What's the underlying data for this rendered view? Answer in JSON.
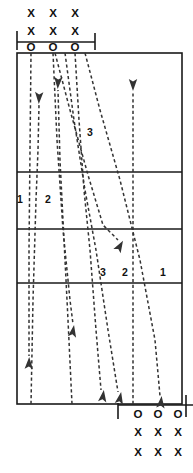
{
  "diagram": {
    "type": "play-diagram",
    "colors": {
      "line": "#1a1a1a",
      "route": "#333333",
      "background": "#ffffff",
      "text": "#111111"
    },
    "field": {
      "left": 17,
      "right": 182,
      "top": 53,
      "bottom": 404,
      "yard_lines_y": [
        172,
        229,
        283
      ]
    },
    "scrimmage": {
      "top": {
        "y": 42,
        "x1": 17,
        "x2": 95
      },
      "bottom": {
        "y": 405,
        "x1": 118,
        "x2": 193
      }
    },
    "top_formation": {
      "rows": [
        {
          "symbol": "X",
          "y": 14,
          "xs": [
            31,
            53,
            75
          ]
        },
        {
          "symbol": "X",
          "y": 32,
          "xs": [
            31,
            53,
            75
          ]
        },
        {
          "symbol": "O",
          "y": 48,
          "xs": [
            31,
            53,
            75
          ]
        }
      ]
    },
    "bottom_formation": {
      "rows": [
        {
          "symbol": "O",
          "y": 415,
          "xs": [
            138,
            158,
            178
          ]
        },
        {
          "symbol": "X",
          "y": 433,
          "xs": [
            138,
            158,
            178
          ]
        },
        {
          "symbol": "X",
          "y": 453,
          "xs": [
            138,
            158,
            178
          ]
        }
      ]
    },
    "route_labels": [
      {
        "text": "3",
        "x": 90,
        "y": 133
      },
      {
        "text": "1",
        "x": 20,
        "y": 200
      },
      {
        "text": "2",
        "x": 48,
        "y": 200
      },
      {
        "text": "3",
        "x": 103,
        "y": 273
      },
      {
        "text": "2",
        "x": 125,
        "y": 273
      },
      {
        "text": "1",
        "x": 163,
        "y": 273
      }
    ],
    "routes": [
      {
        "id": "route-up-1",
        "label": "1",
        "direction": "up",
        "points": "31,404 33,300 36,200 38,150 39,105",
        "arrow": {
          "x": 39,
          "y": 98,
          "angle": 182
        }
      },
      {
        "id": "route-up-2",
        "label": "2",
        "direction": "up",
        "points": "72,404 68,320 64,240 60,160 58,90",
        "arrow": {
          "x": 58,
          "y": 83,
          "angle": 183
        }
      },
      {
        "id": "route-up-3",
        "label": "3",
        "direction": "up",
        "points": "133,404 133,300 133,200 133,130 133,92",
        "arrow": {
          "x": 133,
          "y": 85,
          "angle": 180
        }
      },
      {
        "id": "route-down-1",
        "label": "1",
        "direction": "down",
        "points": "75,53 79,120 84,190 90,250 96,330 101,390",
        "arrow": {
          "x": 103,
          "y": 396,
          "angle": 8
        }
      },
      {
        "id": "route-down-2",
        "label": "2",
        "direction": "down",
        "points": "65,53 74,120 85,190 96,250 108,330 118,392",
        "arrow": {
          "x": 120,
          "y": 398,
          "angle": 11
        }
      },
      {
        "id": "route-down-3",
        "label": "3",
        "direction": "down",
        "points": "55,53 70,110 88,175 103,225 118,240",
        "arrow": {
          "x": 120,
          "y": 246,
          "angle": 30
        }
      },
      {
        "id": "route-down-4",
        "label": "",
        "direction": "down",
        "points": "31,53 30,150 29,250 29,330 29,356",
        "arrow": {
          "x": 29,
          "y": 363,
          "angle": 2
        }
      },
      {
        "id": "route-down-5",
        "label": "",
        "direction": "down",
        "points": "53,53 57,140 63,230 70,300 73,324",
        "arrow": {
          "x": 73,
          "y": 331,
          "angle": 10
        }
      },
      {
        "id": "route-down-6",
        "label": "",
        "direction": "down",
        "points": "85,53 100,110 120,180 140,260 155,340 160,396",
        "arrow": {
          "x": 161,
          "y": 402,
          "angle": 6
        }
      }
    ]
  }
}
